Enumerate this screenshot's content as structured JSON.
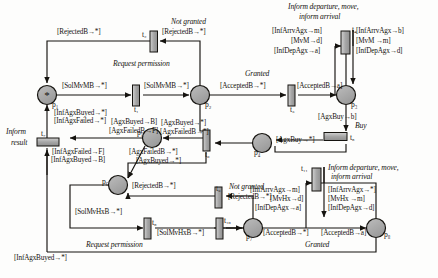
{
  "diagram": {
    "type": "petri-net",
    "places": [
      {
        "id": "p1",
        "label": "p₁",
        "token": "*",
        "cx": 47,
        "cy": 95,
        "r": 9.5
      },
      {
        "id": "p2",
        "label": "p₂",
        "token": "",
        "cx": 200,
        "cy": 95,
        "r": 9.5
      },
      {
        "id": "p3",
        "label": "p₃",
        "token": "",
        "cx": 346,
        "cy": 95,
        "r": 9.5
      },
      {
        "id": "p4",
        "label": "p₄",
        "token": "",
        "cx": 262,
        "cy": 143,
        "r": 9.5
      },
      {
        "id": "p5",
        "label": "p₅",
        "token": "",
        "cx": 152,
        "cy": 138,
        "r": 9.5
      },
      {
        "id": "p6",
        "label": "p₆",
        "token": "",
        "cx": 118,
        "cy": 185,
        "r": 9.5
      },
      {
        "id": "p7",
        "label": "p₇",
        "token": "",
        "cx": 253,
        "cy": 228,
        "r": 9.5
      },
      {
        "id": "p8",
        "label": "p₈",
        "token": "",
        "cx": 376,
        "cy": 228,
        "r": 9.5
      }
    ],
    "transitions": [
      {
        "id": "t1",
        "label": "t₁",
        "x": 136,
        "y": 86,
        "w": 7,
        "h": 21,
        "orient": "v"
      },
      {
        "id": "t2",
        "label": "t₂",
        "x": 150,
        "y": 35,
        "w": 7,
        "h": 21,
        "orient": "v"
      },
      {
        "id": "t3",
        "label": "t₃",
        "x": 291,
        "y": 86,
        "w": 7,
        "h": 21,
        "orient": "v"
      },
      {
        "id": "t4",
        "label": "t₄",
        "x": 341,
        "y": 33,
        "w": 9,
        "h": 23,
        "orient": "v"
      },
      {
        "id": "t5",
        "label": "t₅",
        "x": 323,
        "y": 136,
        "w": 23,
        "h": 8,
        "orient": "h"
      },
      {
        "id": "t6",
        "label": "t₆",
        "x": 203,
        "y": 131,
        "w": 7,
        "h": 21,
        "orient": "v"
      },
      {
        "id": "t7",
        "label": "t₇",
        "x": 45,
        "y": 141,
        "w": 21,
        "h": 7,
        "orient": "h"
      },
      {
        "id": "t8",
        "label": "t₈",
        "x": 148,
        "y": 219,
        "w": 7,
        "h": 21,
        "orient": "v"
      },
      {
        "id": "t9",
        "label": "t₉",
        "x": 215,
        "y": 189,
        "w": 7,
        "h": 21,
        "orient": "v"
      },
      {
        "id": "t10",
        "label": "t₁₀",
        "x": 219,
        "y": 219,
        "w": 7,
        "h": 21,
        "orient": "v"
      },
      {
        "id": "t11",
        "label": "t₁₁",
        "x": 312,
        "y": 170,
        "w": 9,
        "h": 23,
        "orient": "v"
      }
    ],
    "event_labels": [
      {
        "id": "not-granted-top",
        "text": "Not granted",
        "x": 171,
        "y": 22,
        "style": "ital"
      },
      {
        "id": "request-permission-top",
        "text": "Request permission",
        "x": 113,
        "y": 64,
        "style": "ital"
      },
      {
        "id": "granted-top",
        "text": "Granted",
        "x": 245,
        "y": 73,
        "style": "ital"
      },
      {
        "id": "inform-departure-top-1",
        "text": "Inform departure, move,",
        "x": 288,
        "y": 7,
        "style": "ital"
      },
      {
        "id": "inform-departure-top-2",
        "text": "inform arrival",
        "x": 299,
        "y": 17,
        "style": "ital"
      },
      {
        "id": "buy-label",
        "text": "Buy",
        "x": 355,
        "y": 126,
        "style": "ital"
      },
      {
        "id": "inform-result-1",
        "text": "Inform",
        "x": 6,
        "y": 132,
        "style": "ital"
      },
      {
        "id": "inform-result-2",
        "text": "result",
        "x": 11,
        "y": 143,
        "style": "ital"
      },
      {
        "id": "not-granted-bottom",
        "text": "Not granted",
        "x": 229,
        "y": 186,
        "style": "ital"
      },
      {
        "id": "inform-departure-bottom-1",
        "text": "Inform departure, move,",
        "x": 328,
        "y": 168,
        "style": "ital"
      },
      {
        "id": "inform-departure-bottom-2",
        "text": "inform arrival",
        "x": 331,
        "y": 177,
        "style": "ital"
      },
      {
        "id": "request-permission-bottom",
        "text": "Request permission",
        "x": 86,
        "y": 245,
        "style": "ital"
      },
      {
        "id": "granted-bottom",
        "text": "Granted",
        "x": 305,
        "y": 245,
        "style": "ital"
      }
    ],
    "arc_labels": [
      {
        "id": "a-rejected-left-top",
        "text": "[RejectedB→*]",
        "x": 57,
        "y": 32
      },
      {
        "id": "a-rejected-right-top",
        "text": "[RejectedB→*]",
        "x": 162,
        "y": 32
      },
      {
        "id": "a-solmvmb-left",
        "text": "[SolMvMB→*]",
        "x": 62,
        "y": 86
      },
      {
        "id": "a-solmvmb-right",
        "text": "[SolMvMB→*]",
        "x": 144,
        "y": 86
      },
      {
        "id": "a-acceptedb-left-top",
        "text": "[AcceptedB→*]",
        "x": 222,
        "y": 86
      },
      {
        "id": "a-acceptedb-right-top",
        "text": "[AcceptedB→a]",
        "x": 299,
        "y": 86
      },
      {
        "id": "a-infarrvagx-m",
        "text": "[InfArrvAgx→m]",
        "x": 276,
        "y": 30
      },
      {
        "id": "a-mvm-d",
        "text": "[MvM→d]",
        "x": 293,
        "y": 40
      },
      {
        "id": "a-infdepagx-a",
        "text": "[InfDepAgx→a]",
        "x": 280,
        "y": 50
      },
      {
        "id": "a-infarrvagx-b",
        "text": "[InfArrvAgx→b]",
        "x": 352,
        "y": 30
      },
      {
        "id": "a-mvm-m",
        "text": "[MvM →m]",
        "x": 352,
        "y": 40
      },
      {
        "id": "a-infdepagx-d",
        "text": "[InfDepAgx→d]",
        "x": 352,
        "y": 50
      },
      {
        "id": "a-agxbuy-b",
        "text": "[AgxBuy→b]",
        "x": 318,
        "y": 117
      },
      {
        "id": "a-agxbuy-star",
        "text": "[AgxBuy→*]",
        "x": 276,
        "y": 140
      },
      {
        "id": "a-infagxbuyed-star-up",
        "text": "[InfAgxBuyed→*]",
        "x": 56,
        "y": 113
      },
      {
        "id": "a-infagxfailed-star-up",
        "text": "[InfAgxFailed→*]",
        "x": 56,
        "y": 121
      },
      {
        "id": "a-agxbuyed-B",
        "text": "[AgxBuyed→B]",
        "x": 112,
        "y": 122
      },
      {
        "id": "a-agxfailedb-F",
        "text": "[AgxFailedB→F]",
        "x": 110,
        "y": 131
      },
      {
        "id": "a-agxbuyed-star-right",
        "text": "[AgxBuyed→*]",
        "x": 159,
        "y": 123
      },
      {
        "id": "a-agxfailedb-star-right",
        "text": "[AgxFailedB→*]",
        "x": 158,
        "y": 132
      },
      {
        "id": "a-agxbuy-star-p4",
        "text": "[AgxBuy→*]",
        "x": 272,
        "y": 140
      },
      {
        "id": "a-infagxfailed-F",
        "text": "[InfAgxFailed→F]",
        "x": 52,
        "y": 152
      },
      {
        "id": "a-infagxbuyed-B",
        "text": "[InfAgxBuyed→B]",
        "x": 51,
        "y": 160
      },
      {
        "id": "a-agxfailedb-star-down",
        "text": "[AgxFailedB→*]",
        "x": 129,
        "y": 152
      },
      {
        "id": "a-agxbuyed-star-down",
        "text": "[AgxBuyed→*]",
        "x": 135,
        "y": 161
      },
      {
        "id": "a-rejectedb-star-mid",
        "text": "[RejectedB→*]",
        "x": 134,
        "y": 186
      },
      {
        "id": "a-rejected-b-right-mid",
        "text": "[RejectedB→*]",
        "x": 229,
        "y": 197
      },
      {
        "id": "a-solmvhxb-left",
        "text": "[SolMvHxB→*]",
        "x": 75,
        "y": 212
      },
      {
        "id": "a-solmvhxb-right",
        "text": "[SolMvHxB→*]",
        "x": 157,
        "y": 233
      },
      {
        "id": "a-infarrvagx-m-b",
        "text": "[InfArrvAgx→m]",
        "x": 252,
        "y": 189
      },
      {
        "id": "a-mvhx-d",
        "text": "[MvHx→d]",
        "x": 272,
        "y": 198
      },
      {
        "id": "a-infdepagx-a-b",
        "text": "[InfDepAgx→a]",
        "x": 262,
        "y": 207
      },
      {
        "id": "a-infarrvagx-star",
        "text": "[InfArrvAgx→*]",
        "x": 328,
        "y": 189
      },
      {
        "id": "a-mvhx-m",
        "text": "[MvHx →m]",
        "x": 328,
        "y": 198
      },
      {
        "id": "a-infdepagx-d-b",
        "text": "[InfDepAgx→d]",
        "x": 328,
        "y": 207
      },
      {
        "id": "a-acceptedb-left-bot",
        "text": "[AcceptedB→*]",
        "x": 265,
        "y": 232
      },
      {
        "id": "a-acceptedb-right-bot",
        "text": "[AcceptedB→a]",
        "x": 323,
        "y": 232
      },
      {
        "id": "a-infagxbuyed-star-bottom",
        "text": "[InfAgxBuyed→*]",
        "x": 14,
        "y": 258
      }
    ],
    "colors": {
      "stroke": "#15130f",
      "place_fill": "#a8a8a8",
      "transition_fill": "#b0b0b0",
      "background": "#fdfdfc"
    }
  }
}
